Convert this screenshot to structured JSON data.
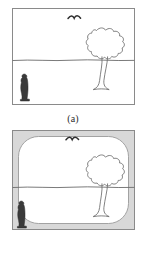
{
  "figure": {
    "type": "two-panel line drawing comparison",
    "background_color": "#ffffff",
    "ink_color": "#555555",
    "panels": [
      {
        "id": "a",
        "caption": "(a)",
        "frame_style": "plain rectangular border",
        "frame_color": "#8a8a8a",
        "elements": [
          {
            "name": "bird",
            "label": "seagull",
            "description": "small flying bird in sky"
          },
          {
            "name": "tree",
            "label": "tree",
            "description": "deciduous tree with bumpy cloud-shaped crown and flared Y trunk"
          },
          {
            "name": "horizon",
            "label": "horizon line",
            "description": "wavy ground line across scene"
          },
          {
            "name": "person",
            "label": "person",
            "description": "small dark standing figure at left"
          }
        ]
      },
      {
        "id": "b",
        "caption": "(b)",
        "frame_style": "rounded inner frame inside gray outer border (vignette)",
        "frame_color": "#8a8a8a",
        "vignette_color": "#d8d8d8",
        "elements": [
          {
            "name": "bird",
            "label": "seagull",
            "description": "small flying bird touching the rounded top frame"
          },
          {
            "name": "tree",
            "label": "tree",
            "description": "deciduous tree with bumpy cloud-shaped crown and flared Y trunk"
          },
          {
            "name": "horizon",
            "label": "horizon line",
            "description": "wavy ground line spanning full outer frame width"
          },
          {
            "name": "person",
            "label": "person",
            "description": "small dark standing figure at left overlapping the rounded frame"
          }
        ]
      }
    ]
  },
  "captions": {
    "a": "(a)",
    "b": "(b)"
  },
  "colors": {
    "ink": "#555555",
    "frame": "#8a8a8a",
    "vignette": "#d8d8d8",
    "person": "#3a3a3a",
    "background": "#ffffff"
  }
}
